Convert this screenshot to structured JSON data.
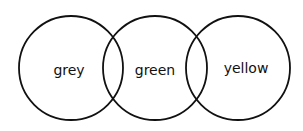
{
  "diagram": {
    "type": "venn-chain",
    "stroke_color": "#111111",
    "background": "#ffffff",
    "circles": [
      {
        "label": "grey",
        "cx": 71,
        "cy": 68,
        "r": 52
      },
      {
        "label": "green",
        "cx": 155,
        "cy": 68,
        "r": 52
      },
      {
        "label": "yellow",
        "cx": 238,
        "cy": 68,
        "r": 52
      }
    ]
  }
}
